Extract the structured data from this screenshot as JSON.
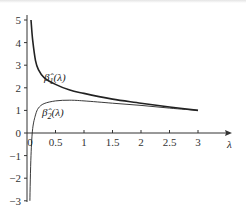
{
  "chart_data": {
    "type": "line",
    "title": "",
    "xlabel": "λ",
    "ylabel": "",
    "xlim": [
      0,
      3.5
    ],
    "ylim": [
      -3,
      5
    ],
    "grid": false,
    "x_ticks": [
      "0",
      "0.5",
      "1",
      "1.5",
      "2",
      "2.5",
      "3"
    ],
    "y_ticks": [
      "5",
      "4",
      "3",
      "2",
      "1",
      "0",
      "−1",
      "−2",
      "−3"
    ],
    "series": [
      {
        "name": "β̂1(λ)",
        "label_main": "β̂",
        "label_sub": "1",
        "label_arg": "(λ)",
        "stroke_width": 1.6,
        "x": [
          0.07,
          0.1,
          0.15,
          0.2,
          0.3,
          0.5,
          0.75,
          1.0,
          1.5,
          2.0,
          2.5,
          3.0
        ],
        "y": [
          5.0,
          4.1,
          3.2,
          2.8,
          2.45,
          2.15,
          1.9,
          1.75,
          1.5,
          1.32,
          1.15,
          1.0
        ]
      },
      {
        "name": "β̂2(λ)",
        "label_main": "β̂",
        "label_sub": "2",
        "label_arg": "(λ)",
        "stroke_width": 0.9,
        "x": [
          0.05,
          0.07,
          0.1,
          0.15,
          0.2,
          0.3,
          0.5,
          0.75,
          1.0,
          1.5,
          2.0,
          2.5,
          3.0
        ],
        "y": [
          -3.0,
          -1.0,
          0.2,
          0.8,
          1.1,
          1.3,
          1.42,
          1.45,
          1.42,
          1.32,
          1.22,
          1.1,
          1.0
        ]
      }
    ],
    "legend": "inline labels near curves"
  },
  "axis": {
    "x_label": "λ",
    "origin_label": "0"
  },
  "colors": {
    "axis": "#333333",
    "curve": "#222222",
    "background": "#ffffff"
  }
}
